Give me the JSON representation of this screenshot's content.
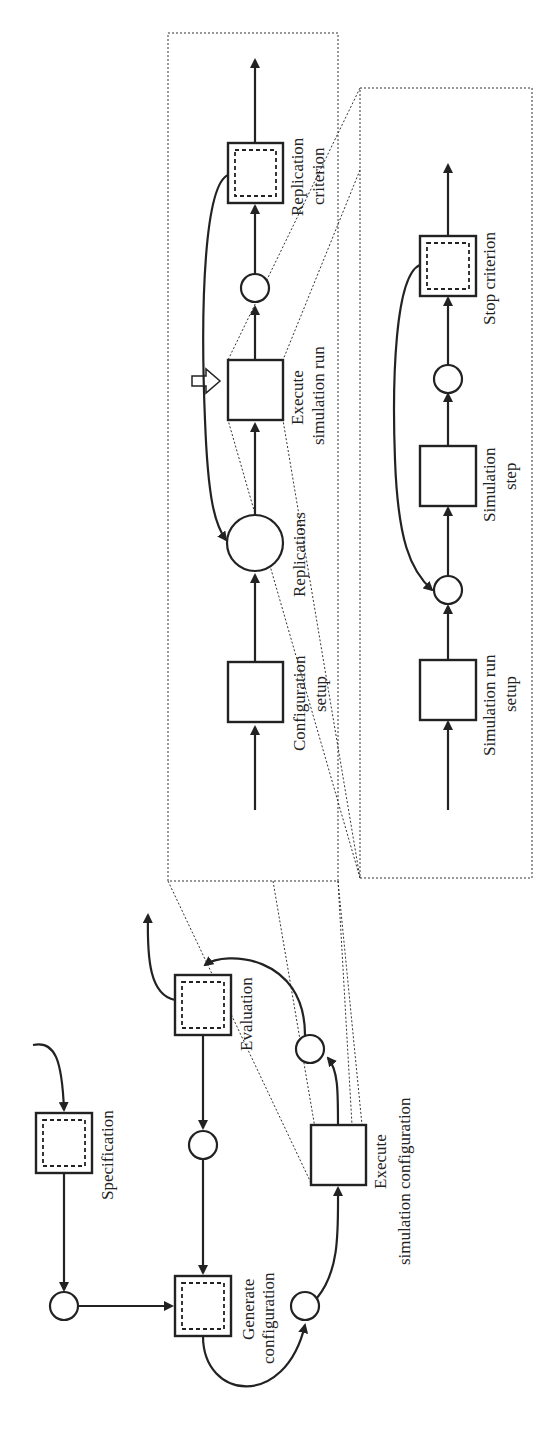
{
  "diagram": {
    "orientation": "rotated-90-ccw",
    "main_process": {
      "specification": "Specification",
      "generate_configuration": [
        "Generate",
        "configuration"
      ],
      "execute_simulation_configuration": [
        "Execute",
        "simulation configuration"
      ],
      "evaluation": "Evaluation"
    },
    "configuration_detail": {
      "configuration_setup": [
        "Configuration",
        "setup"
      ],
      "replications": "Replications",
      "execute_simulation_run": [
        "Execute",
        "simulation run"
      ],
      "replication_criterion": [
        "Replication",
        "criterion"
      ]
    },
    "run_detail": {
      "simulation_run_setup": [
        "Simulation run",
        "setup"
      ],
      "simulation_step": [
        "Simulation",
        "step"
      ],
      "stop_criterion": "Stop criterion"
    }
  },
  "colors": {
    "stroke": "#222222",
    "background": "#ffffff"
  }
}
